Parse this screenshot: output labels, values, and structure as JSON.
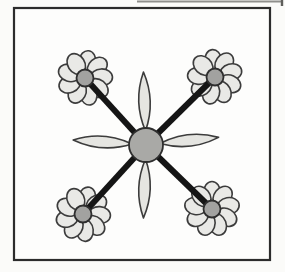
{
  "illustration": {
    "description": "hand-drawn flower diagram: central flower linked by four diagonal lines to four corner daisies"
  },
  "canvas": {
    "width": 285,
    "height": 272,
    "background": "#fbfbf9"
  },
  "scan_artifact": {
    "x1": 137,
    "y1": 1.5,
    "x2": 283,
    "y2": 1.5,
    "stroke": "#8f8f8c",
    "stroke_width": 2,
    "tick_x": 282,
    "tick_y1": 0,
    "tick_y2": 6,
    "tick_stroke": "#5f5f5c",
    "tick_width": 2.4
  },
  "frame": {
    "x": 14,
    "y": 8,
    "width": 256,
    "height": 252,
    "fill": "#fdfdfc",
    "stroke": "#2c2c2c",
    "stroke_width": 2.2
  },
  "style": {
    "petal_fill": "#e9e9e6",
    "petal_stroke": "#3c3c3c",
    "petal_stroke_width": 1.6,
    "center_fill": "#a2a2a0",
    "center_stroke": "#2e2e2e",
    "center_stroke_width": 1.8,
    "connector_color": "#151515",
    "connector_width": 6
  },
  "center_flower": {
    "cx": 146,
    "cy": 145,
    "center_radius": 17,
    "center_fill": "#a9a9a6",
    "petal_fill": "#e5e5e1",
    "petal_inner": 14,
    "petal_length": 73,
    "petal_half_width": 11.5,
    "petal_angles": [
      -2,
      84,
      182,
      -86
    ]
  },
  "corner_flower_geometry": {
    "petal_count": 9,
    "petal_distance": 16.5,
    "petal_rx": 8.5,
    "petal_ry": 11,
    "center_radius": 8.5
  },
  "corner_flowers": [
    {
      "name": "top-left",
      "cx": 85,
      "cy": 78,
      "rotation": 8
    },
    {
      "name": "top-right",
      "cx": 215,
      "cy": 77,
      "rotation": -6
    },
    {
      "name": "bottom-left",
      "cx": 83,
      "cy": 214,
      "rotation": 14
    },
    {
      "name": "bottom-right",
      "cx": 212,
      "cy": 209,
      "rotation": 0
    }
  ]
}
